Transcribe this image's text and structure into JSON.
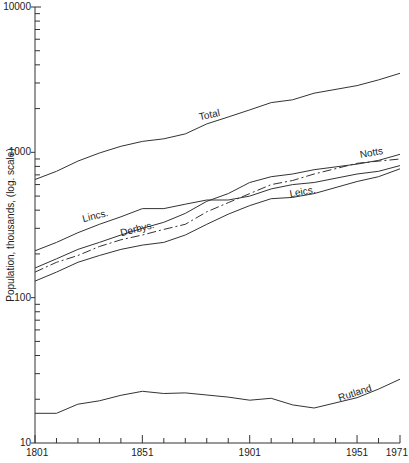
{
  "chart_data": {
    "type": "line",
    "title": "",
    "xlabel": "",
    "ylabel": "Population, thousands, (log. scale)",
    "yscale": "log",
    "ylim": [
      10,
      10000
    ],
    "xlim": [
      1801,
      1971
    ],
    "x_tick_labels": [
      "1801",
      "1851",
      "1901",
      "1951",
      "1971"
    ],
    "y_tick_labels": [
      "10",
      "100",
      "1000",
      "10000"
    ],
    "grid": false,
    "legend": "inline labels",
    "x": [
      1801,
      1811,
      1821,
      1831,
      1841,
      1851,
      1861,
      1871,
      1881,
      1891,
      1901,
      1911,
      1921,
      1931,
      1951,
      1961,
      1971
    ],
    "series": [
      {
        "name": "Total",
        "style": "solid",
        "label_pos": [
          0.45,
          "above"
        ],
        "values": [
          650,
          740,
          870,
          990,
          1100,
          1190,
          1240,
          1340,
          1570,
          1750,
          1960,
          2200,
          2300,
          2550,
          2880,
          3150,
          3500
        ]
      },
      {
        "name": "Lincs.",
        "style": "solid",
        "values": [
          210,
          240,
          280,
          320,
          360,
          410,
          410,
          440,
          470,
          470,
          500,
          560,
          600,
          620,
          710,
          740,
          810
        ]
      },
      {
        "name": "Notts",
        "style": "dash-dot",
        "values": [
          150,
          175,
          195,
          225,
          250,
          270,
          295,
          320,
          390,
          450,
          520,
          600,
          640,
          710,
          840,
          870,
          900
        ]
      },
      {
        "name": "Derbys.",
        "style": "solid",
        "values": [
          160,
          185,
          215,
          240,
          270,
          300,
          330,
          380,
          460,
          520,
          620,
          680,
          710,
          760,
          830,
          880,
          970
        ]
      },
      {
        "name": "Leics.",
        "style": "solid",
        "values": [
          130,
          150,
          175,
          195,
          215,
          230,
          240,
          270,
          320,
          375,
          430,
          480,
          490,
          520,
          630,
          680,
          770
        ]
      },
      {
        "name": "Rutland",
        "style": "solid",
        "values": [
          16,
          16,
          18.5,
          19.5,
          21.3,
          22.7,
          21.9,
          22.1,
          21.4,
          20.7,
          19.7,
          20.3,
          18.3,
          17.4,
          20.5,
          23.5,
          27.5
        ]
      }
    ]
  },
  "plot": {
    "x0": 35,
    "x1": 400,
    "year0": 1801,
    "year1": 1971,
    "y_top": 7,
    "y_bottom": 443,
    "log_min": 1,
    "log_max": 4
  },
  "labels": {
    "ylabel": "Population, thousands, (log. scale)",
    "x_ticks": [
      {
        "year": 1801,
        "text": "1801"
      },
      {
        "year": 1851,
        "text": "1851"
      },
      {
        "year": 1901,
        "text": "1901"
      },
      {
        "year": 1951,
        "text": "1951"
      },
      {
        "year": 1971,
        "text": "1971"
      }
    ],
    "y_ticks": [
      {
        "v": 10,
        "text": "10"
      },
      {
        "v": 100,
        "text": "100"
      },
      {
        "v": 1000,
        "text": "1000"
      },
      {
        "v": 10000,
        "text": "10000"
      }
    ],
    "series_labels": [
      {
        "text": "Total",
        "x": 210,
        "y": 118,
        "rot": -12
      },
      {
        "text": "Lincs.",
        "x": 96,
        "y": 219,
        "rot": -14
      },
      {
        "text": "Derbys.",
        "x": 138,
        "y": 232,
        "rot": -14
      },
      {
        "text": "Notts",
        "x": 372,
        "y": 156,
        "rot": -10
      },
      {
        "text": "Leics.",
        "x": 303,
        "y": 195,
        "rot": -10
      },
      {
        "text": "Rutland",
        "x": 356,
        "y": 396,
        "rot": -18
      }
    ]
  },
  "colors": {
    "line": "#333333",
    "axis": "#333333",
    "text": "#222222",
    "background": "#ffffff"
  }
}
